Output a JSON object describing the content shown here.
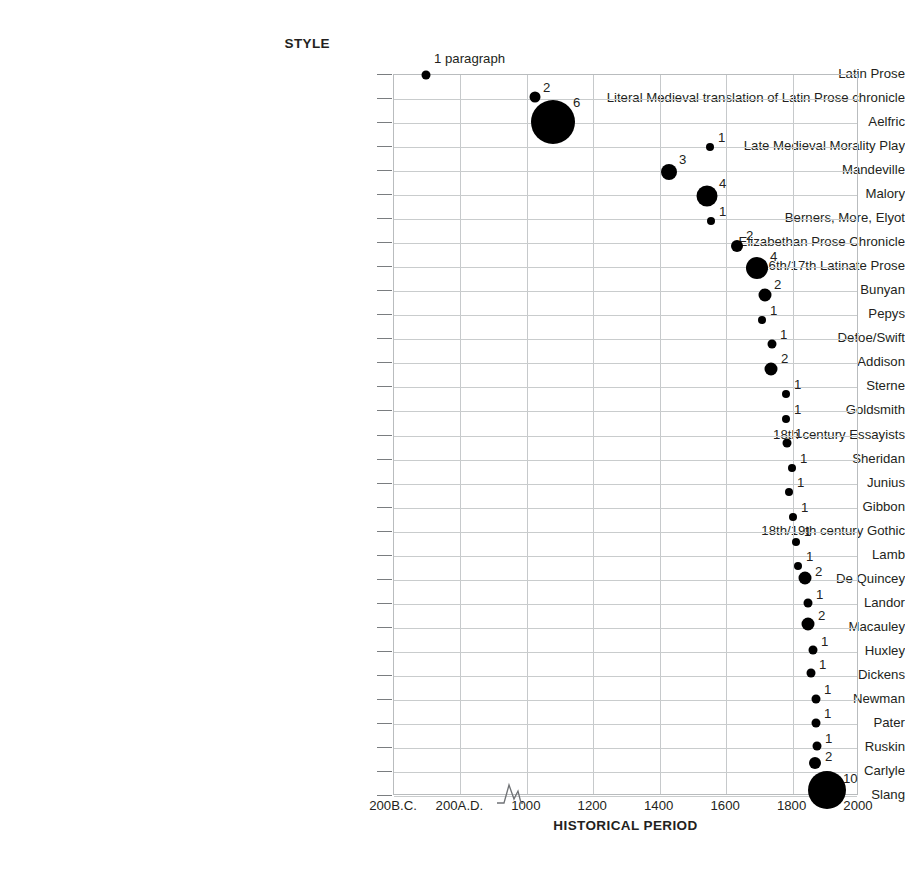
{
  "titles": {
    "y_axis": "STYLE",
    "x_axis": "HISTORICAL PERIOD"
  },
  "axis": {
    "x_ticks": [
      "200B.C.",
      "200A.D.",
      "1000",
      "1200",
      "1400",
      "1600",
      "1800",
      "2000"
    ],
    "break_after": "200A.D."
  },
  "chart_data": {
    "type": "scatter",
    "title": "",
    "xlabel": "HISTORICAL PERIOD",
    "ylabel": "STYLE",
    "grid": true,
    "legend": "none",
    "note": "Bubble area encodes the labelled count; x position is the historical period, y position is the style category. The x axis contains a scale break between 200A.D. and 1000.",
    "x_tick_labels": [
      "200B.C.",
      "200A.D.",
      "1000",
      "1200",
      "1400",
      "1600",
      "1800",
      "2000"
    ],
    "categories": [
      "Latin Prose",
      "Literal Medieval translation of Latin Prose chronicle",
      "Aelfric",
      "Late Medieval Morality Play",
      "Mandeville",
      "Malory",
      "Berners, More, Elyot",
      "Elizabethan Prose Chronicle",
      "16th/17th Latinate Prose",
      "Bunyan",
      "Pepys",
      "Defoe/Swift",
      "Addison",
      "Sterne",
      "Goldsmith",
      "18th century Essayists",
      "Sheridan",
      "Junius",
      "Gibbon",
      "18th/19th century Gothic",
      "Lamb",
      "De Quincey",
      "Landor",
      "Macauley",
      "Huxley",
      "Dickens",
      "Newman",
      "Pater",
      "Ruskin",
      "Carlyle",
      "Slang"
    ],
    "points": [
      {
        "category": "Latin Prose",
        "x_label": "200B.C.",
        "value": 1,
        "value_label": "1 paragraph",
        "px": 426,
        "py": 75,
        "d": 9,
        "lx": 434,
        "ly": 52
      },
      {
        "category": "Literal Medieval translation of Latin Prose chronicle",
        "x_label": "900",
        "value": 2,
        "value_label": "2",
        "px": 535,
        "py": 97,
        "d": 11,
        "lx": 543,
        "ly": 81
      },
      {
        "category": "Aelfric",
        "x_label": "1000",
        "value": 6,
        "value_label": "6",
        "px": 553,
        "py": 122,
        "d": 44,
        "lx": 573,
        "ly": 96
      },
      {
        "category": "Late Medieval Morality Play",
        "x_label": "1480",
        "value": 1,
        "value_label": "1",
        "px": 710,
        "py": 147,
        "d": 8,
        "lx": 718,
        "ly": 131
      },
      {
        "category": "Mandeville",
        "x_label": "1360",
        "value": 3,
        "value_label": "3",
        "px": 669,
        "py": 172,
        "d": 16,
        "lx": 679,
        "ly": 153
      },
      {
        "category": "Malory",
        "x_label": "1490",
        "value": 4,
        "value_label": "4",
        "px": 707,
        "py": 196,
        "d": 21,
        "lx": 719,
        "ly": 177
      },
      {
        "category": "Berners, More, Elyot",
        "x_label": "1500",
        "value": 1,
        "value_label": "1",
        "px": 711,
        "py": 221,
        "d": 8,
        "lx": 719,
        "ly": 205
      },
      {
        "category": "Elizabethan Prose Chronicle",
        "x_label": "1590",
        "value": 2,
        "value_label": "2",
        "px": 737,
        "py": 246,
        "d": 12,
        "lx": 746,
        "ly": 229
      },
      {
        "category": "16th/17th Latinate Prose",
        "x_label": "1660",
        "value": 4,
        "value_label": "4",
        "px": 757,
        "py": 268,
        "d": 22,
        "lx": 770,
        "ly": 250
      },
      {
        "category": "Bunyan",
        "x_label": "1680",
        "value": 2,
        "value_label": "2",
        "px": 765,
        "py": 295,
        "d": 13,
        "lx": 774,
        "ly": 278
      },
      {
        "category": "Pepys",
        "x_label": "1670",
        "value": 1,
        "value_label": "1",
        "px": 762,
        "py": 320,
        "d": 8,
        "lx": 770,
        "ly": 304
      },
      {
        "category": "Defoe/Swift",
        "x_label": "1710",
        "value": 1,
        "value_label": "1",
        "px": 772,
        "py": 344,
        "d": 9,
        "lx": 780,
        "ly": 328
      },
      {
        "category": "Addison",
        "x_label": "1710",
        "value": 2,
        "value_label": "2",
        "px": 771,
        "py": 369,
        "d": 13,
        "lx": 781,
        "ly": 352
      },
      {
        "category": "Sterne",
        "x_label": "1760",
        "value": 1,
        "value_label": "1",
        "px": 786,
        "py": 394,
        "d": 8,
        "lx": 794,
        "ly": 378
      },
      {
        "category": "Goldsmith",
        "x_label": "1760",
        "value": 1,
        "value_label": "1",
        "px": 786,
        "py": 419,
        "d": 8,
        "lx": 794,
        "ly": 403
      },
      {
        "category": "18th century Essayists",
        "x_label": "1760",
        "value": 1,
        "value_label": "1",
        "px": 787,
        "py": 443,
        "d": 9,
        "lx": 795,
        "ly": 427
      },
      {
        "category": "Sheridan",
        "x_label": "1775",
        "value": 1,
        "value_label": "1",
        "px": 792,
        "py": 468,
        "d": 8,
        "lx": 800,
        "ly": 452
      },
      {
        "category": "Junius",
        "x_label": "1770",
        "value": 1,
        "value_label": "1",
        "px": 789,
        "py": 492,
        "d": 8,
        "lx": 797,
        "ly": 476
      },
      {
        "category": "Gibbon",
        "x_label": "1780",
        "value": 1,
        "value_label": "1",
        "px": 793,
        "py": 517,
        "d": 8,
        "lx": 801,
        "ly": 501
      },
      {
        "category": "18th/19th century Gothic",
        "x_label": "1790",
        "value": 1,
        "value_label": "1",
        "px": 796,
        "py": 542,
        "d": 8,
        "lx": 804,
        "ly": 525
      },
      {
        "category": "Lamb",
        "x_label": "1800",
        "value": 1,
        "value_label": "1",
        "px": 798,
        "py": 566,
        "d": 8,
        "lx": 806,
        "ly": 550
      },
      {
        "category": "De Quincey",
        "x_label": "1810",
        "value": 2,
        "value_label": "2",
        "px": 805,
        "py": 578,
        "d": 13,
        "lx": 815,
        "ly": 565
      },
      {
        "category": "Landor",
        "x_label": "1820",
        "value": 1,
        "value_label": "1",
        "px": 808,
        "py": 603,
        "d": 9,
        "lx": 816,
        "ly": 588
      },
      {
        "category": "Macauley",
        "x_label": "1830",
        "value": 2,
        "value_label": "2",
        "px": 808,
        "py": 624,
        "d": 13,
        "lx": 818,
        "ly": 609
      },
      {
        "category": "Huxley",
        "x_label": "1840",
        "value": 1,
        "value_label": "1",
        "px": 813,
        "py": 650,
        "d": 9,
        "lx": 821,
        "ly": 635
      },
      {
        "category": "Dickens",
        "x_label": "1840",
        "value": 1,
        "value_label": "1",
        "px": 811,
        "py": 673,
        "d": 9,
        "lx": 819,
        "ly": 658
      },
      {
        "category": "Newman",
        "x_label": "1850",
        "value": 1,
        "value_label": "1",
        "px": 816,
        "py": 699,
        "d": 9,
        "lx": 824,
        "ly": 683
      },
      {
        "category": "Pater",
        "x_label": "1860",
        "value": 1,
        "value_label": "1",
        "px": 816,
        "py": 723,
        "d": 9,
        "lx": 824,
        "ly": 707
      },
      {
        "category": "Ruskin",
        "x_label": "1860",
        "value": 1,
        "value_label": "1",
        "px": 817,
        "py": 746,
        "d": 9,
        "lx": 825,
        "ly": 732
      },
      {
        "category": "Carlyle",
        "x_label": "1870",
        "value": 2,
        "value_label": "2",
        "px": 815,
        "py": 763,
        "d": 12,
        "lx": 825,
        "ly": 750
      },
      {
        "category": "Slang",
        "x_label": "1900",
        "value": 10,
        "value_label": "10",
        "px": 827,
        "py": 790,
        "d": 38,
        "lx": 843,
        "ly": 772
      }
    ]
  }
}
